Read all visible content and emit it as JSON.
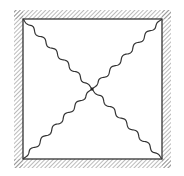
{
  "diagram": {
    "title": "",
    "colors": {
      "background": "#ffffff",
      "line": "#333333",
      "hatch": "#777777",
      "node": "#222222"
    },
    "frame": {
      "inner": {
        "x1": 23,
        "y1": 19,
        "x2": 162,
        "y2": 159
      },
      "hatch_width": 9,
      "hatch_spacing": 3,
      "hatch_orientation": "diagonal-forward"
    },
    "center_node": {
      "x": 92,
      "y": 89,
      "r": 1.6
    },
    "springs": [
      {
        "id": "top-left",
        "from": [
          23,
          19
        ],
        "to": [
          92,
          89
        ],
        "waves": 6,
        "amplitude": 1.8
      },
      {
        "id": "top-right",
        "from": [
          162,
          19
        ],
        "to": [
          92,
          89
        ],
        "waves": 6,
        "amplitude": 1.8
      },
      {
        "id": "bottom-left",
        "from": [
          23,
          159
        ],
        "to": [
          92,
          89
        ],
        "waves": 6,
        "amplitude": 1.8
      },
      {
        "id": "bottom-right",
        "from": [
          162,
          159
        ],
        "to": [
          92,
          89
        ],
        "waves": 6,
        "amplitude": 1.8
      }
    ]
  }
}
